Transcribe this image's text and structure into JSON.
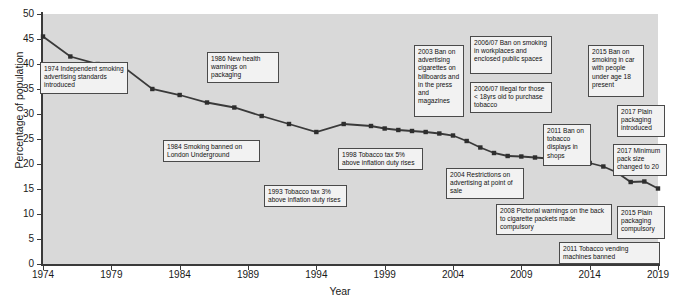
{
  "chart_data": {
    "type": "line",
    "title": "",
    "xlabel": "Year",
    "ylabel": "Percentage of population",
    "xlim": [
      1974,
      2019
    ],
    "ylim": [
      0,
      50
    ],
    "grid": false,
    "legend": null,
    "ytick_labels": [
      "0",
      "5",
      "10",
      "15",
      "20",
      "25",
      "30",
      "35",
      "40",
      "45",
      "50"
    ],
    "ytick_values": [
      0,
      5,
      10,
      15,
      20,
      25,
      30,
      35,
      40,
      45,
      50
    ],
    "xtick_labels": [
      "1974",
      "1979",
      "1984",
      "1989",
      "1994",
      "1999",
      "2004",
      "2009",
      "2014",
      "2019"
    ],
    "xtick_values": [
      1974,
      1979,
      1984,
      1989,
      1994,
      1999,
      2004,
      2009,
      2014,
      2019
    ],
    "series": [
      {
        "name": "Percentage of population smoking",
        "x": [
          1974,
          1976,
          1978,
          1980,
          1982,
          1984,
          1986,
          1988,
          1990,
          1992,
          1994,
          1996,
          1998,
          1999,
          2000,
          2001,
          2002,
          2003,
          2004,
          2005,
          2006,
          2007,
          2008,
          2009,
          2010,
          2011,
          2012,
          2013,
          2014,
          2015,
          2016,
          2017,
          2018,
          2019
        ],
        "values": [
          45.5,
          41.5,
          40.0,
          39.2,
          35.0,
          33.8,
          32.3,
          31.3,
          29.6,
          28.0,
          26.4,
          28.0,
          27.6,
          27.1,
          26.8,
          26.6,
          26.4,
          26.1,
          25.7,
          24.6,
          23.3,
          22.2,
          21.6,
          21.5,
          21.3,
          21.1,
          20.7,
          21.3,
          20.2,
          19.5,
          18.3,
          16.4,
          16.5,
          15.1
        ]
      }
    ],
    "annotations": [
      {
        "id": "ann-1974",
        "text": "1974 Independent smoking advertising standards introduced"
      },
      {
        "id": "ann-1984",
        "text": "1984 Smoking banned on London Underground"
      },
      {
        "id": "ann-1986",
        "text": "1986 New health warnings on packaging"
      },
      {
        "id": "ann-1993",
        "text": "1993 Tobacco tax 3% above inflation duty rises"
      },
      {
        "id": "ann-1998",
        "text": "1998 Tobacco tax 5% above inflation duty rises"
      },
      {
        "id": "ann-2003",
        "text": "2003 Ban on advertising cigarettes on billboards and in the press and magazines"
      },
      {
        "id": "ann-2004",
        "text": "2004 Restrictions on advertising at point of sale"
      },
      {
        "id": "ann-2006-07-ban",
        "text": "2006/07 Ban on smoking in workplaces and enclosed public spaces"
      },
      {
        "id": "ann-2006-07-illegal",
        "text": "2006/07 Illegal for those < 18yrs old to purchase tobacco"
      },
      {
        "id": "ann-2008",
        "text": "2008 Pictorial warnings on the back to cigarette packets made compulsory"
      },
      {
        "id": "ann-2011-displays",
        "text": "2011 Ban on tobacco displays in shops"
      },
      {
        "id": "ann-2011-vending",
        "text": "2011 Tobacco vending machines banned"
      },
      {
        "id": "ann-2015-car",
        "text": "2015 Ban on smoking in car with people under age 18 present"
      },
      {
        "id": "ann-2015-plain",
        "text": "2015 Plain packaging compulsory"
      },
      {
        "id": "ann-2017-plain",
        "text": "2017 Plain packaging introduced"
      },
      {
        "id": "ann-2017-pack",
        "text": "2017 Minimum pack size changed to 20"
      }
    ],
    "colors": {
      "plot_background": "#d9d9d9",
      "page_background": "#ffffff",
      "line": "#3a3a3a",
      "marker": "#2e2e2e",
      "axis": "#3a3a3a",
      "note_background": "#f2f2f2",
      "note_border": "#4a4a4a",
      "text": "#111111"
    }
  }
}
